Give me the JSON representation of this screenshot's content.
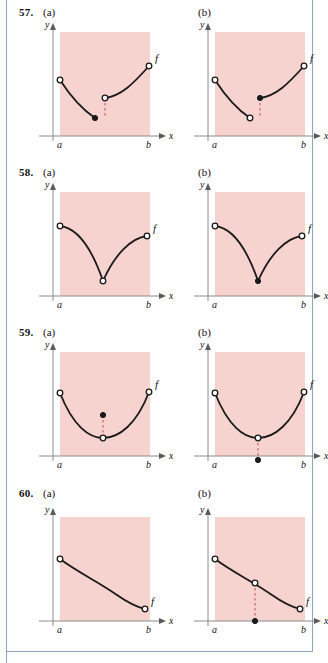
{
  "page": {
    "background": "#ffffff",
    "frame_color": "#8fa5bd",
    "shade_color": "#f7d3cf",
    "axis_color": "#8a8a8a",
    "curve_color": "#1a1a1a"
  },
  "labels": {
    "y": "y",
    "x": "x",
    "a": "a",
    "b": "b",
    "f": "f",
    "part_a": "(a)",
    "part_b": "(b)"
  },
  "problems": [
    {
      "number": "57.",
      "panels": [
        {
          "part": "(a)",
          "description": "decreasing branch from open circle at a down to filled dot; second branch starts at open circle above it and increases to open circle at b; vertical dashed segment joins the open circle to the filled dot below",
          "curves": [
            {
              "path": "M 27,62 C 40,82 50,92 62,100",
              "dash": false
            },
            {
              "path": "M 72,80 C 88,78 100,66 116,48",
              "dash": false
            }
          ],
          "connector": {
            "x": 72,
            "y1": 80,
            "y2": 100
          },
          "points": [
            {
              "x": 27,
              "y": 62,
              "fill": "open"
            },
            {
              "x": 62,
              "y": 100,
              "fill": "closed"
            },
            {
              "x": 72,
              "y": 80,
              "fill": "open"
            },
            {
              "x": 116,
              "y": 48,
              "fill": "open"
            }
          ],
          "f_label": {
            "x": 122,
            "y": 44
          }
        },
        {
          "part": "(b)",
          "description": "decreasing branch from open circle at a down to open circle; second branch starts at filled dot above it and increases to open circle at b; vertical dashed segment joins the filled dot to the open circle below",
          "curves": [
            {
              "path": "M 27,62 C 40,82 50,92 62,100",
              "dash": false
            },
            {
              "path": "M 72,80 C 88,78 100,66 116,48",
              "dash": false
            }
          ],
          "connector": {
            "x": 72,
            "y1": 80,
            "y2": 100
          },
          "points": [
            {
              "x": 27,
              "y": 62,
              "fill": "open"
            },
            {
              "x": 62,
              "y": 100,
              "fill": "open"
            },
            {
              "x": 72,
              "y": 80,
              "fill": "closed"
            },
            {
              "x": 116,
              "y": 48,
              "fill": "open"
            }
          ],
          "f_label": {
            "x": 122,
            "y": 44
          }
        }
      ]
    },
    {
      "number": "58.",
      "panels": [
        {
          "part": "(a)",
          "description": "V-shaped cusp: curve falls from open circle at a to an open circle at the bottom vertex, then rises to an open circle near b",
          "curves": [
            {
              "path": "M 27,48 C 46,50 60,74 70,103",
              "dash": false
            },
            {
              "path": "M 70,103 C 82,76 98,60 114,58",
              "dash": false
            }
          ],
          "connector": null,
          "points": [
            {
              "x": 27,
              "y": 48,
              "fill": "open"
            },
            {
              "x": 70,
              "y": 103,
              "fill": "open"
            },
            {
              "x": 114,
              "y": 58,
              "fill": "open"
            }
          ],
          "f_label": {
            "x": 120,
            "y": 54
          }
        },
        {
          "part": "(b)",
          "description": "V-shaped cusp: curve falls from open circle at a to a filled dot at the bottom vertex, then rises to an open circle near b",
          "curves": [
            {
              "path": "M 27,48 C 46,50 60,74 70,103",
              "dash": false
            },
            {
              "path": "M 70,103 C 82,76 98,60 114,58",
              "dash": false
            }
          ],
          "connector": null,
          "points": [
            {
              "x": 27,
              "y": 48,
              "fill": "open"
            },
            {
              "x": 70,
              "y": 103,
              "fill": "closed"
            },
            {
              "x": 114,
              "y": 58,
              "fill": "open"
            }
          ],
          "f_label": {
            "x": 120,
            "y": 54
          }
        }
      ]
    },
    {
      "number": "59.",
      "panels": [
        {
          "part": "(a)",
          "description": "smooth U-shaped parabola from open circle at a to open circle near b, with an open circle at the minimum and a filled dot directly above it, joined by a vertical dashed segment",
          "curves": [
            {
              "path": "M 27,55 C 40,88 56,100 70,100 C 86,100 104,86 116,54",
              "dash": false
            }
          ],
          "connector": {
            "x": 70,
            "y1": 77,
            "y2": 100
          },
          "points": [
            {
              "x": 27,
              "y": 55,
              "fill": "open"
            },
            {
              "x": 70,
              "y": 100,
              "fill": "open"
            },
            {
              "x": 70,
              "y": 77,
              "fill": "closed"
            },
            {
              "x": 116,
              "y": 54,
              "fill": "open"
            }
          ],
          "f_label": {
            "x": 122,
            "y": 50
          }
        },
        {
          "part": "(b)",
          "description": "smooth U-shaped parabola from open circle at a to open circle near b, with an open circle at the minimum and a filled dot directly below it, joined by a vertical dashed segment",
          "curves": [
            {
              "path": "M 27,55 C 40,88 56,100 70,100 C 86,100 104,86 116,54",
              "dash": false
            }
          ],
          "connector": {
            "x": 70,
            "y1": 100,
            "y2": 122
          },
          "points": [
            {
              "x": 27,
              "y": 55,
              "fill": "open"
            },
            {
              "x": 70,
              "y": 100,
              "fill": "open"
            },
            {
              "x": 70,
              "y": 122,
              "fill": "closed"
            },
            {
              "x": 116,
              "y": 54,
              "fill": "open"
            }
          ],
          "f_label": {
            "x": 122,
            "y": 50
          }
        }
      ]
    },
    {
      "number": "60.",
      "panels": [
        {
          "part": "(a)",
          "description": "gently decreasing S-shaped curve from open circle at a down to open circle near b, no removed point",
          "curves": [
            {
              "path": "M 27,56 C 46,70 64,78 84,92 C 94,99 104,104 112,106",
              "dash": false
            }
          ],
          "connector": null,
          "points": [
            {
              "x": 27,
              "y": 56,
              "fill": "open"
            },
            {
              "x": 112,
              "y": 106,
              "fill": "open"
            }
          ],
          "f_label": {
            "x": 118,
            "y": 102
          }
        },
        {
          "part": "(b)",
          "description": "gently decreasing S-shaped curve from open circle at a down to open circle near b, with an open circle on the curve midway and a filled dot far below it joined by a vertical dashed segment",
          "curves": [
            {
              "path": "M 27,56 C 46,70 64,78 84,92 C 94,99 104,104 112,106",
              "dash": false
            }
          ],
          "connector": {
            "x": 67,
            "y1": 80,
            "y2": 118
          },
          "points": [
            {
              "x": 27,
              "y": 56,
              "fill": "open"
            },
            {
              "x": 67,
              "y": 80,
              "fill": "open"
            },
            {
              "x": 67,
              "y": 118,
              "fill": "closed"
            },
            {
              "x": 112,
              "y": 106,
              "fill": "open"
            }
          ],
          "f_label": {
            "x": 118,
            "y": 102
          }
        }
      ]
    }
  ]
}
